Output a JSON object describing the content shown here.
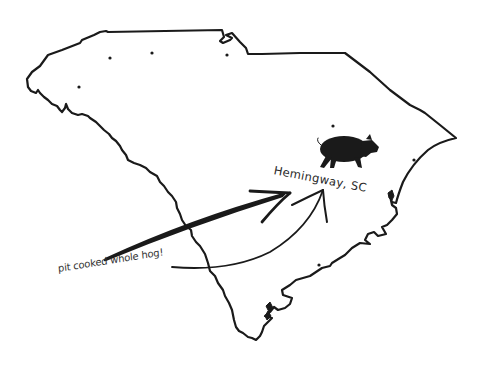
{
  "map": {
    "region": "South Carolina",
    "outline_color": "#1a1a1a",
    "background_color": "#ffffff",
    "marker": {
      "label": "Hemingway, SC",
      "icon": "pig-icon",
      "icon_color": "#1a1a1a"
    },
    "callout": {
      "text": "pit cooked whole hog!"
    },
    "dots": [
      {
        "x": 79,
        "y": 87
      },
      {
        "x": 110,
        "y": 58
      },
      {
        "x": 152,
        "y": 53
      },
      {
        "x": 227,
        "y": 55
      },
      {
        "x": 333,
        "y": 126
      },
      {
        "x": 414,
        "y": 160
      },
      {
        "x": 319,
        "y": 265
      }
    ],
    "arrows": [
      {
        "style": "thick-straight",
        "from": [
          105,
          260
        ],
        "to": [
          285,
          195
        ]
      },
      {
        "style": "thin-curved",
        "from": [
          172,
          267
        ],
        "to": [
          323,
          190
        ]
      }
    ]
  }
}
